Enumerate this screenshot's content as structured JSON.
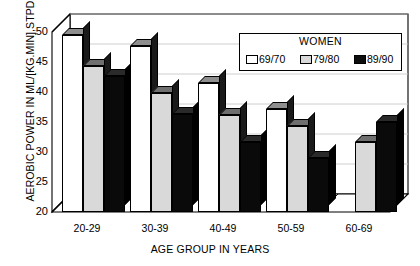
{
  "chart_data": {
    "type": "bar",
    "title": "",
    "xlabel": "AGE GROUP IN YEARS",
    "ylabel": "AEROBIC POWER IN ML/[KG.MIN],STPD",
    "categories": [
      "20-29",
      "30-39",
      "40-49",
      "50-59",
      "60-69"
    ],
    "series": [
      {
        "name": "69/70",
        "color": "#ffffff",
        "values": [
          49.5,
          47.7,
          41.5,
          37.2,
          null
        ]
      },
      {
        "name": "79/80",
        "color": "#d9d9d9",
        "values": [
          44.3,
          39.8,
          36.2,
          34.4,
          31.7
        ]
      },
      {
        "name": "89/90",
        "color": "#0d0d0d",
        "values": [
          42.6,
          36.4,
          31.6,
          29.0,
          35.0
        ]
      }
    ],
    "ylim": [
      20,
      50
    ],
    "yticks": [
      20,
      25,
      30,
      35,
      40,
      45,
      50
    ],
    "ytick_labels": [
      "20",
      "25",
      "30",
      "35",
      "40",
      "45",
      "50"
    ],
    "grid": true,
    "legend_title": "WOMEN",
    "legend_position": "upper-right",
    "style": "3d-bar"
  },
  "legend": {
    "title": "WOMEN",
    "items": [
      {
        "label": "69/70",
        "swatch": "white"
      },
      {
        "label": "79/80",
        "swatch": "gray"
      },
      {
        "label": "89/90",
        "swatch": "black"
      }
    ]
  }
}
